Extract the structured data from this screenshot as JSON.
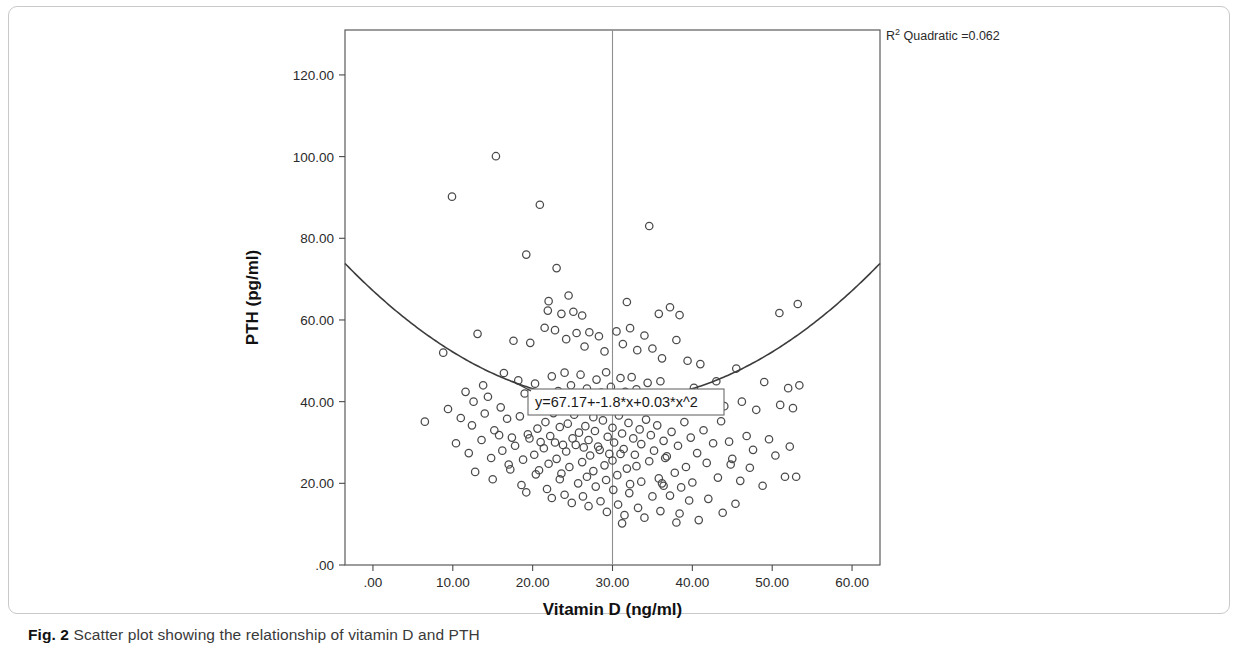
{
  "caption": {
    "label": "Fig. 2",
    "text": "Scatter plot showing the relationship of vitamin D and PTH"
  },
  "chart_data": {
    "type": "scatter",
    "title": "",
    "xlabel": "Vitamin D (ng/ml)",
    "ylabel": "PTH (pg/ml)",
    "xlim": [
      -3.5,
      63.5
    ],
    "ylim": [
      0,
      131
    ],
    "xticks": [
      0,
      10,
      20,
      30,
      40,
      50,
      60
    ],
    "xticklabels": [
      ".00",
      "10.00",
      "20.00",
      "30.00",
      "40.00",
      "50.00",
      "60.00"
    ],
    "yticks": [
      0,
      20,
      40,
      60,
      80,
      100,
      120
    ],
    "yticklabels": [
      ".00",
      "20.00",
      "40.00",
      "60.00",
      "80.00",
      "100.00",
      "120.00"
    ],
    "grid": false,
    "legend": null,
    "marker": "open-circle",
    "marker_color": "#4a4a4a",
    "fit": {
      "type": "quadratic",
      "equation_label": "y=67.17+-1.8*x+0.03*x^2",
      "intercept": 67.17,
      "linear_coef": -1.8,
      "quadratic_coef": 0.03,
      "r_squared_label": "R² Quadratic =0.062",
      "r_squared_prefix": "R",
      "r_squared_sup": "2",
      "r_squared_suffix": " Quadratic =0.062",
      "r_squared": 0.062,
      "color": "#3c3c3c"
    },
    "reference_line": {
      "orientation": "vertical",
      "x": 30,
      "color": "#8f8f8f"
    },
    "points": [
      [
        9.9,
        90.2
      ],
      [
        15.4,
        100.1
      ],
      [
        20.9,
        88.2
      ],
      [
        34.6,
        83.0
      ],
      [
        19.2,
        76.0
      ],
      [
        23.0,
        72.7
      ],
      [
        24.5,
        66.0
      ],
      [
        22.0,
        64.6
      ],
      [
        21.9,
        62.3
      ],
      [
        23.6,
        61.5
      ],
      [
        25.1,
        62.0
      ],
      [
        26.2,
        61.1
      ],
      [
        31.8,
        64.4
      ],
      [
        35.8,
        61.5
      ],
      [
        37.2,
        63.1
      ],
      [
        38.4,
        61.2
      ],
      [
        50.9,
        61.7
      ],
      [
        53.2,
        63.9
      ],
      [
        8.8,
        52.0
      ],
      [
        13.1,
        56.6
      ],
      [
        17.6,
        54.9
      ],
      [
        19.7,
        54.4
      ],
      [
        21.5,
        58.1
      ],
      [
        22.8,
        57.5
      ],
      [
        24.2,
        55.3
      ],
      [
        25.5,
        56.8
      ],
      [
        26.5,
        53.5
      ],
      [
        27.1,
        57.0
      ],
      [
        28.3,
        56.0
      ],
      [
        29.0,
        52.3
      ],
      [
        30.5,
        57.2
      ],
      [
        31.3,
        54.1
      ],
      [
        32.2,
        58.0
      ],
      [
        33.1,
        52.6
      ],
      [
        34.0,
        56.2
      ],
      [
        35.0,
        53.0
      ],
      [
        36.2,
        50.6
      ],
      [
        38.0,
        55.1
      ],
      [
        39.4,
        50.0
      ],
      [
        41.0,
        49.2
      ],
      [
        43.0,
        45.0
      ],
      [
        45.5,
        48.1
      ],
      [
        49.0,
        44.8
      ],
      [
        52.0,
        43.3
      ],
      [
        53.4,
        44.0
      ],
      [
        16.4,
        47.0
      ],
      [
        18.2,
        45.2
      ],
      [
        19.0,
        42.0
      ],
      [
        20.3,
        44.4
      ],
      [
        21.2,
        40.2
      ],
      [
        22.4,
        46.2
      ],
      [
        23.2,
        42.6
      ],
      [
        24.0,
        47.1
      ],
      [
        24.8,
        44.0
      ],
      [
        25.6,
        41.1
      ],
      [
        26.0,
        46.6
      ],
      [
        26.8,
        43.2
      ],
      [
        27.4,
        40.7
      ],
      [
        28.0,
        45.4
      ],
      [
        28.6,
        42.2
      ],
      [
        29.2,
        47.2
      ],
      [
        29.8,
        43.6
      ],
      [
        30.4,
        40.9
      ],
      [
        31.0,
        45.8
      ],
      [
        31.6,
        42.4
      ],
      [
        32.4,
        46.0
      ],
      [
        33.0,
        43.0
      ],
      [
        33.8,
        40.4
      ],
      [
        34.4,
        44.6
      ],
      [
        35.4,
        41.8
      ],
      [
        36.0,
        45.0
      ],
      [
        37.0,
        42.0
      ],
      [
        38.8,
        40.1
      ],
      [
        40.2,
        43.4
      ],
      [
        42.2,
        41.0
      ],
      [
        44.0,
        38.9
      ],
      [
        46.2,
        40.0
      ],
      [
        48.0,
        38.0
      ],
      [
        51.0,
        39.2
      ],
      [
        52.6,
        38.4
      ],
      [
        6.5,
        35.1
      ],
      [
        11.0,
        36.0
      ],
      [
        12.4,
        34.2
      ],
      [
        14.0,
        37.1
      ],
      [
        15.2,
        33.0
      ],
      [
        16.8,
        35.8
      ],
      [
        17.4,
        31.2
      ],
      [
        18.4,
        36.4
      ],
      [
        19.4,
        32.0
      ],
      [
        20.0,
        37.8
      ],
      [
        20.6,
        33.4
      ],
      [
        21.0,
        30.1
      ],
      [
        21.6,
        35.0
      ],
      [
        22.2,
        31.6
      ],
      [
        22.6,
        37.2
      ],
      [
        23.4,
        33.8
      ],
      [
        23.8,
        29.4
      ],
      [
        24.4,
        34.6
      ],
      [
        25.0,
        31.0
      ],
      [
        25.2,
        36.8
      ],
      [
        25.8,
        32.4
      ],
      [
        26.4,
        28.8
      ],
      [
        26.6,
        34.0
      ],
      [
        27.0,
        30.6
      ],
      [
        27.6,
        36.2
      ],
      [
        27.8,
        32.8
      ],
      [
        28.2,
        29.0
      ],
      [
        28.8,
        35.4
      ],
      [
        29.4,
        31.4
      ],
      [
        29.6,
        27.2
      ],
      [
        30.0,
        33.6
      ],
      [
        30.2,
        30.0
      ],
      [
        30.8,
        36.6
      ],
      [
        31.2,
        32.2
      ],
      [
        31.4,
        28.4
      ],
      [
        32.0,
        34.8
      ],
      [
        32.6,
        31.0
      ],
      [
        32.8,
        27.0
      ],
      [
        33.4,
        33.2
      ],
      [
        33.6,
        29.6
      ],
      [
        34.2,
        35.6
      ],
      [
        34.8,
        31.8
      ],
      [
        35.2,
        28.0
      ],
      [
        35.6,
        34.2
      ],
      [
        36.4,
        30.4
      ],
      [
        36.8,
        26.6
      ],
      [
        37.4,
        32.6
      ],
      [
        38.2,
        29.2
      ],
      [
        39.0,
        35.0
      ],
      [
        39.8,
        31.2
      ],
      [
        40.6,
        27.4
      ],
      [
        41.4,
        33.0
      ],
      [
        42.6,
        29.8
      ],
      [
        43.6,
        35.2
      ],
      [
        44.6,
        30.2
      ],
      [
        45.0,
        26.0
      ],
      [
        46.8,
        31.6
      ],
      [
        47.6,
        28.2
      ],
      [
        49.6,
        30.8
      ],
      [
        50.4,
        26.8
      ],
      [
        52.2,
        29.0
      ],
      [
        10.4,
        29.8
      ],
      [
        12.0,
        27.4
      ],
      [
        13.6,
        30.6
      ],
      [
        14.8,
        26.2
      ],
      [
        15.8,
        31.8
      ],
      [
        16.2,
        28.0
      ],
      [
        17.0,
        24.6
      ],
      [
        17.8,
        29.2
      ],
      [
        18.8,
        25.8
      ],
      [
        19.6,
        31.0
      ],
      [
        20.2,
        27.0
      ],
      [
        20.8,
        23.2
      ],
      [
        21.4,
        28.6
      ],
      [
        22.0,
        24.8
      ],
      [
        22.8,
        30.0
      ],
      [
        23.0,
        26.0
      ],
      [
        23.6,
        22.4
      ],
      [
        24.2,
        27.8
      ],
      [
        24.6,
        24.0
      ],
      [
        25.4,
        29.4
      ],
      [
        26.2,
        25.2
      ],
      [
        26.8,
        21.6
      ],
      [
        27.2,
        26.8
      ],
      [
        27.6,
        23.0
      ],
      [
        28.4,
        28.2
      ],
      [
        29.0,
        24.4
      ],
      [
        29.2,
        20.8
      ],
      [
        30.0,
        25.6
      ],
      [
        30.6,
        22.0
      ],
      [
        31.0,
        27.2
      ],
      [
        31.8,
        23.6
      ],
      [
        32.2,
        19.8
      ],
      [
        33.0,
        24.2
      ],
      [
        33.6,
        20.4
      ],
      [
        34.6,
        25.4
      ],
      [
        35.8,
        21.2
      ],
      [
        36.6,
        26.2
      ],
      [
        37.8,
        22.6
      ],
      [
        38.6,
        19.0
      ],
      [
        39.2,
        24.0
      ],
      [
        40.0,
        20.2
      ],
      [
        41.8,
        25.0
      ],
      [
        43.2,
        21.4
      ],
      [
        44.8,
        24.6
      ],
      [
        46.0,
        20.6
      ],
      [
        47.2,
        23.8
      ],
      [
        48.8,
        19.4
      ],
      [
        51.6,
        21.6
      ],
      [
        12.8,
        22.8
      ],
      [
        15.0,
        21.0
      ],
      [
        17.2,
        23.4
      ],
      [
        18.6,
        19.6
      ],
      [
        19.2,
        17.8
      ],
      [
        20.4,
        22.2
      ],
      [
        21.8,
        18.6
      ],
      [
        22.4,
        16.4
      ],
      [
        23.4,
        21.0
      ],
      [
        24.0,
        17.2
      ],
      [
        24.9,
        15.2
      ],
      [
        25.7,
        20.0
      ],
      [
        26.3,
        16.8
      ],
      [
        27.0,
        14.4
      ],
      [
        27.9,
        19.2
      ],
      [
        28.5,
        15.6
      ],
      [
        29.3,
        13.0
      ],
      [
        30.1,
        18.4
      ],
      [
        30.7,
        14.8
      ],
      [
        31.5,
        12.2
      ],
      [
        32.1,
        17.6
      ],
      [
        33.2,
        14.0
      ],
      [
        34.0,
        11.6
      ],
      [
        35.0,
        16.8
      ],
      [
        36.0,
        13.2
      ],
      [
        37.2,
        17.0
      ],
      [
        38.4,
        12.6
      ],
      [
        39.6,
        15.8
      ],
      [
        40.8,
        11.0
      ],
      [
        42.0,
        16.2
      ],
      [
        43.8,
        12.8
      ],
      [
        45.4,
        15.0
      ],
      [
        53.0,
        21.6
      ],
      [
        38.0,
        10.4
      ],
      [
        31.2,
        10.2
      ],
      [
        36.2,
        20.0
      ],
      [
        36.4,
        19.4
      ],
      [
        12.6,
        40.0
      ],
      [
        14.4,
        41.2
      ],
      [
        16.0,
        38.6
      ],
      [
        13.8,
        44.0
      ],
      [
        11.6,
        42.4
      ],
      [
        9.4,
        38.2
      ]
    ]
  }
}
